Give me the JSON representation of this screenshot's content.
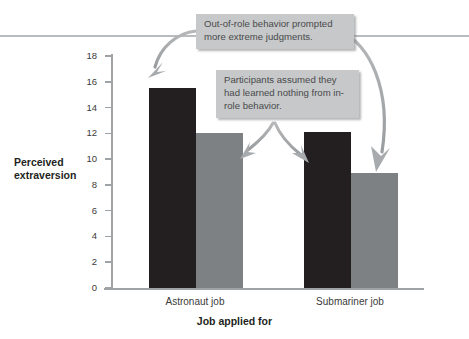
{
  "figure": {
    "annotations": [
      {
        "id": "callout-1",
        "text": "Out-of-role behavior prompted more extreme judgments."
      },
      {
        "id": "callout-2",
        "text": "Participants assumed they had learned nothing from in-role behavior."
      }
    ]
  },
  "chart_data": {
    "type": "bar",
    "title": "",
    "xlabel": "Job applied for",
    "ylabel": "Perceived extraversion",
    "categories": [
      "Astronaut job",
      "Submariner job"
    ],
    "series": [
      {
        "name": "out-of-role",
        "color": "#231f20",
        "values": [
          15.5,
          12.1
        ]
      },
      {
        "name": "in-role",
        "color": "#7e8183",
        "values": [
          12.0,
          8.9
        ]
      }
    ],
    "ylim": [
      0,
      18
    ],
    "ytick_labels": [
      "0",
      "2",
      "4",
      "6",
      "8",
      "10",
      "12",
      "14",
      "16",
      "18"
    ],
    "ytick_values": [
      0,
      2,
      4,
      6,
      8,
      10,
      12,
      14,
      16,
      18
    ],
    "grid": false,
    "legend": "none",
    "annotations": [
      {
        "text": "Out-of-role behavior prompted more extreme judgments.",
        "points_to": [
          "Astronaut job out-of-role bar",
          "Submariner job in-role bar"
        ]
      },
      {
        "text": "Participants assumed they had learned nothing from in-role behavior.",
        "points_to": [
          "Astronaut job in-role bar",
          "Submariner job out-of-role bar"
        ]
      }
    ]
  },
  "axis": {
    "y_label_line1": "Perceived",
    "y_label_line2": "extraversion",
    "x_title": "Job applied for"
  }
}
